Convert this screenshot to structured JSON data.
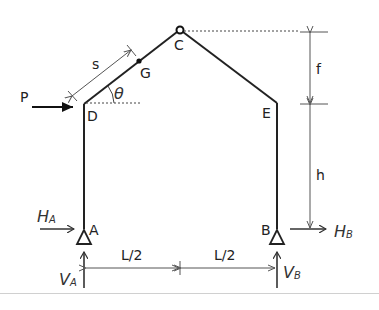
{
  "diagram": {
    "type": "three-hinged portal frame",
    "points": {
      "A": "A",
      "B": "B",
      "C": "C",
      "D": "D",
      "E": "E",
      "G": "G"
    },
    "dimensions": {
      "s": "s",
      "f": "f",
      "h": "h",
      "left_half_span": "L/2",
      "right_half_span": "L/2",
      "angle": "θ"
    },
    "loads": {
      "P": "P"
    },
    "reactions": {
      "HA_main": "H",
      "HA_sub": "A",
      "HB_main": "H",
      "HB_sub": "B",
      "VA_main": "V",
      "VA_sub": "A",
      "VB_main": "V",
      "VB_sub": "B"
    },
    "colors": {
      "member": "#222222",
      "dimension": "#555555",
      "separator": "#d0d0d0"
    }
  }
}
